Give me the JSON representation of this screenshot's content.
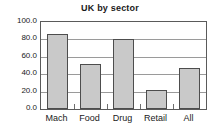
{
  "chart_data": {
    "type": "bar",
    "title": "UK by sector",
    "xlabel": "",
    "ylabel": "",
    "categories": [
      "Mach",
      "Food",
      "Drug",
      "Retail",
      "All"
    ],
    "values": [
      86,
      52,
      80,
      22,
      47
    ],
    "ylim": [
      0,
      100
    ],
    "yticks": [
      0,
      20,
      40,
      60,
      80,
      100
    ],
    "ytick_labels": [
      "0.0",
      "20.0",
      "40.0",
      "60.0",
      "80.0",
      "100.0"
    ],
    "grid": "horizontal",
    "legend": "none",
    "bar_fill_color": "#c9c9c9",
    "bar_border_color": "#4d4d4d",
    "gridline_color": "#9a9a9a",
    "frame_color": "#5a5a5a",
    "text_color": "#1a1a1a",
    "background_color": "#ffffff"
  }
}
